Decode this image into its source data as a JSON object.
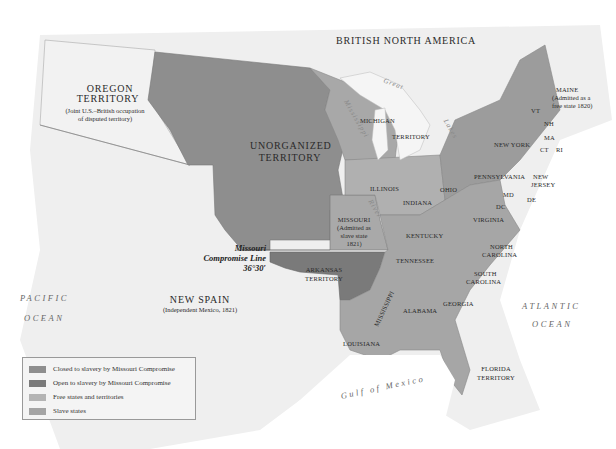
{
  "map": {
    "title_regions": {
      "british_north_america": "BRITISH NORTH AMERICA",
      "oregon": {
        "name": "OREGON",
        "name2": "TERRITORY",
        "note1": "(Joint U.S.–British occupation",
        "note2": "of disputed territory)"
      },
      "unorganized": {
        "name": "UNORGANIZED",
        "name2": "TERRITORY"
      },
      "new_spain": {
        "name": "NEW SPAIN",
        "note": "(Independent Mexico, 1821)"
      },
      "michigan": {
        "name": "MICHIGAN",
        "name2": "TERRITORY"
      },
      "missouri": {
        "name": "MISSOURI",
        "note1": "(Admitted as",
        "note2": "slave state",
        "note3": "1821)"
      },
      "arkansas": {
        "name": "ARKANSAS",
        "name2": "TERRITORY"
      },
      "maine": {
        "name": "MAINE",
        "note1": "(Admitted as a",
        "note2": "free state 1820)"
      },
      "florida": {
        "name": "FLORIDA",
        "name2": "TERRITORY"
      }
    },
    "states": {
      "vt": "VT",
      "nh": "NH",
      "ma": "MA",
      "ct": "CT",
      "ri": "RI",
      "new_york": "NEW YORK",
      "pennsylvania": "PENNSYLVANIA",
      "new_jersey_1": "NEW",
      "new_jersey_2": "JERSEY",
      "md": "MD",
      "dc": "DC",
      "de": "DE",
      "virginia": "VIRGINIA",
      "ohio": "OHIO",
      "indiana": "INDIANA",
      "illinois": "ILLINOIS",
      "kentucky": "KENTUCKY",
      "tennessee": "TENNESSEE",
      "north_carolina_1": "NORTH",
      "north_carolina_2": "CAROLINA",
      "south_carolina_1": "SOUTH",
      "south_carolina_2": "CAROLINA",
      "georgia": "GEORGIA",
      "alabama": "ALABAMA",
      "mississippi": "MISSISSIPPI",
      "louisiana": "LOUISIANA"
    },
    "water": {
      "pacific_1": "PACIFIC",
      "pacific_2": "OCEAN",
      "atlantic_1": "ATLANTIC",
      "atlantic_2": "OCEAN",
      "gulf": "Gulf of Mexico",
      "great": "Great",
      "lakes": "Lakes",
      "mississippi_river": "Mississippi",
      "river": "River"
    },
    "compromise_line": {
      "line1": "Missouri",
      "line2": "Compromise Line",
      "line3": "36°30′"
    }
  },
  "legend": {
    "items": [
      {
        "label": "Closed to slavery by Missouri Compromise",
        "color": "#8e8e8e"
      },
      {
        "label": "Open to slavery by Missouri Compromise",
        "color": "#7a7a7a"
      },
      {
        "label": "Free states and territories",
        "color": "#b4b4b4"
      },
      {
        "label": "Slave states",
        "color": "#a4a4a4"
      }
    ]
  },
  "colors": {
    "closed": "#8e8e8e",
    "open": "#7a7a7a",
    "free": "#b0b0b0",
    "slave": "#a6a6a6",
    "foreign": "#f0f0f0",
    "water": "#ffffff"
  }
}
